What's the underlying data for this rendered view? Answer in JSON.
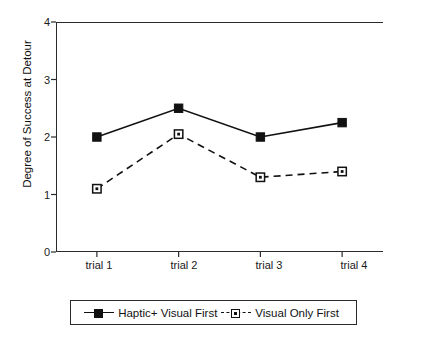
{
  "chart_data": {
    "type": "line",
    "title": "",
    "subtitle": "",
    "xlabel": "",
    "ylabel": "Degree of Success at Detour",
    "categories": [
      "trial 1",
      "trial 2",
      "trial 3",
      "trial 4"
    ],
    "ylim": [
      0,
      4
    ],
    "y_ticks": [
      0,
      1,
      2,
      3,
      4
    ],
    "grid": false,
    "legend_position": "bottom",
    "series": [
      {
        "name": "Haptic+ Visual First",
        "values": [
          2.0,
          2.5,
          2.0,
          2.25
        ],
        "linestyle": "solid",
        "marker": "filled-square",
        "color": "#111111"
      },
      {
        "name": "Visual Only First",
        "values": [
          1.1,
          2.05,
          1.3,
          1.4
        ],
        "linestyle": "dashed",
        "marker": "open-square",
        "color": "#111111"
      }
    ]
  },
  "axes": {
    "y_tick_labels": [
      "0",
      "1",
      "2",
      "3",
      "4"
    ],
    "y_axis_title": "Degree of Success at Detour",
    "x_tick_labels": [
      "trial 1",
      "trial 2",
      "trial 3",
      "trial 4"
    ]
  },
  "legend": {
    "entries": [
      {
        "label": "Haptic+ Visual First",
        "style": "solid-filled-square"
      },
      {
        "label": "Visual Only First",
        "style": "dashed-open-square"
      }
    ]
  },
  "colors": {
    "axis": "#2b2b2b",
    "series": "#111111",
    "background": "#ffffff"
  }
}
